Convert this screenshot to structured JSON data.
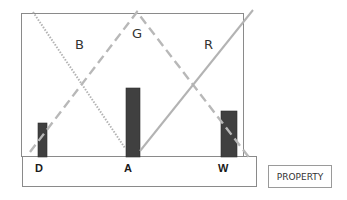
{
  "diagram": {
    "region_labels": {
      "left": "B",
      "middle": "G",
      "right": "R"
    },
    "base_labels": [
      "D",
      "A",
      "W"
    ],
    "legend_box": "PROPERTY",
    "bars": [
      {
        "label": "D",
        "relative_height": 34
      },
      {
        "label": "A",
        "relative_height": 69
      },
      {
        "label": "W",
        "relative_height": 46
      }
    ],
    "lines": [
      {
        "label": "B",
        "style": "dotted",
        "direction": "descending"
      },
      {
        "label": "G",
        "style": "dashed",
        "direction": "inverted-V"
      },
      {
        "label": "R",
        "style": "solid",
        "direction": "ascending"
      }
    ],
    "colors": {
      "bar_fill": "#404040",
      "line_gray": "#b3b3b3",
      "frame": "#808080"
    }
  }
}
